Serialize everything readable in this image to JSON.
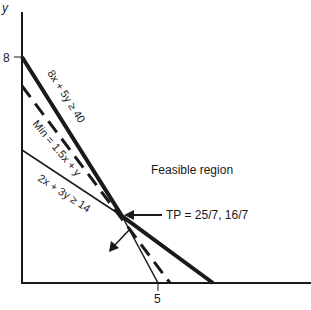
{
  "axes": {
    "y_label": "y",
    "y_tick_label": "8",
    "x_tick_label": "5"
  },
  "lines": {
    "constraint_1": "8x + 5y ≥ 40",
    "objective": "Min = 1.5x + y",
    "constraint_2": "2x + 3y ≥ 14"
  },
  "annotations": {
    "feasible_region": "Feasible region",
    "tangent_point": "TP = 25/7, 16/7"
  },
  "colors": {
    "ink": "#1a1a1a",
    "background": "#ffffff"
  }
}
